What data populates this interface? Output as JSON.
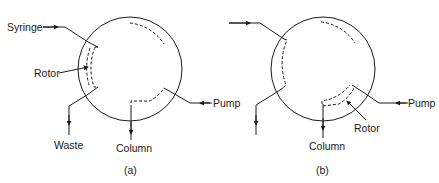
{
  "figure": {
    "panels": [
      {
        "id": "a",
        "caption": "(a)",
        "labels": {
          "syringe": "Syringe",
          "rotor": "Rotor",
          "waste": "Waste",
          "column": "Column",
          "pump": "Pump"
        }
      },
      {
        "id": "b",
        "caption": "(b)",
        "labels": {
          "column": "Column",
          "pump": "Pump",
          "rotor": "Rotor"
        }
      }
    ],
    "colors": {
      "line": "#1a1a1a",
      "background": "#ffffff"
    }
  }
}
